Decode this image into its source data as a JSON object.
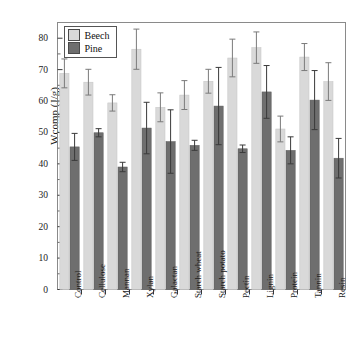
{
  "chart_data": {
    "type": "bar",
    "title": "",
    "xlabel": "",
    "ylabel": "Wcomp (J/g)",
    "ylim": [
      0,
      85
    ],
    "ytick_values": [
      0,
      10,
      20,
      30,
      40,
      50,
      60,
      70,
      80
    ],
    "ytick_labels": [
      "0",
      "10",
      "20",
      "30",
      "40",
      "50",
      "60",
      "70",
      "80"
    ],
    "grid": false,
    "legend_position": "upper-left",
    "categories": [
      "Control",
      "Cellulose",
      "Mannan",
      "Xylan",
      "Galactan",
      "Starch wheat",
      "Starch potato",
      "Pectin",
      "Lignin",
      "Protein",
      "Tannin",
      "Resin"
    ],
    "series": [
      {
        "name": "Beech",
        "color": "#d9d9d9",
        "values": [
          68.8,
          66.0,
          59.4,
          76.5,
          58.0,
          61.9,
          66.3,
          73.7,
          77.0,
          51.1,
          74.0,
          66.2
        ],
        "errors": [
          4.6,
          4.1,
          2.6,
          6.4,
          4.6,
          4.6,
          3.8,
          6.0,
          5.0,
          4.1,
          4.3,
          6.0
        ]
      },
      {
        "name": "Pine",
        "color": "#6e6e6e",
        "values": [
          45.4,
          49.9,
          39.0,
          51.4,
          47.1,
          45.9,
          58.4,
          44.8,
          62.9,
          44.3,
          60.3,
          41.8
        ],
        "errors": [
          4.3,
          1.3,
          1.5,
          8.2,
          10.1,
          1.6,
          12.3,
          1.2,
          8.4,
          4.3,
          9.4,
          6.3
        ]
      }
    ]
  },
  "axis": {
    "y_label": "Wcomp (J/g)"
  },
  "legend": {
    "items": [
      {
        "label": "Beech",
        "swatch": "#d9d9d9"
      },
      {
        "label": "Pine",
        "swatch": "#6e6e6e"
      }
    ]
  }
}
